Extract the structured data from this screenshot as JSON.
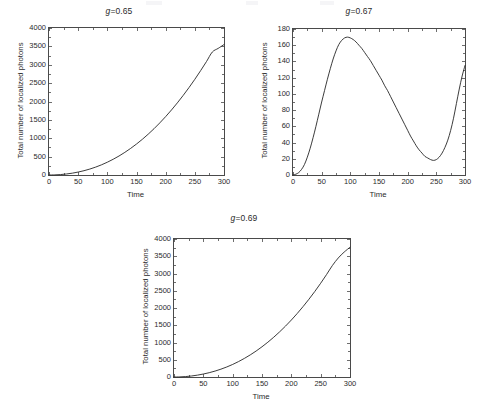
{
  "figure": {
    "background_color": "#ffffff",
    "axis_color": "#4a4a4a",
    "curve_color": "#262626"
  },
  "chart_data": [
    {
      "type": "line",
      "id": "g065",
      "title": "g=0.65",
      "title_symbol": "g",
      "title_rest": "=0.65",
      "xlabel": "Time",
      "ylabel": "Total number of localized photons",
      "xlim": [
        0,
        300
      ],
      "ylim": [
        0,
        4000
      ],
      "xticks": [
        0,
        50,
        100,
        150,
        200,
        250,
        300
      ],
      "xticklabels": [
        "0",
        "50",
        "100",
        "150",
        "200",
        "250",
        "300"
      ],
      "yticks": [
        0,
        500,
        1000,
        1500,
        2000,
        2500,
        3000,
        3500,
        4000
      ],
      "yticklabels": [
        "0",
        "500",
        "1000",
        "1500",
        "2000",
        "2500",
        "3000",
        "3500",
        "4000"
      ],
      "grid": false,
      "legend": "none",
      "series": [
        {
          "name": "Total number of localized photons",
          "x": [
            0,
            10,
            20,
            30,
            40,
            50,
            60,
            70,
            80,
            90,
            100,
            110,
            120,
            130,
            140,
            150,
            160,
            170,
            180,
            190,
            200,
            210,
            220,
            230,
            240,
            250,
            260,
            270,
            280,
            290,
            300
          ],
          "values": [
            0,
            3,
            12,
            28,
            50,
            80,
            117,
            162,
            215,
            277,
            348,
            428,
            517,
            616,
            724,
            843,
            971,
            1110,
            1259,
            1419,
            1589,
            1770,
            1962,
            2165,
            2379,
            2604,
            2841,
            3088,
            3347,
            3445,
            3550
          ]
        }
      ]
    },
    {
      "type": "line",
      "id": "g067",
      "title": "g=0.67",
      "title_symbol": "g",
      "title_rest": "=0.67",
      "xlabel": "Time",
      "ylabel": "Total number of localized photons",
      "xlim": [
        0,
        300
      ],
      "ylim": [
        0,
        180
      ],
      "xticks": [
        0,
        50,
        100,
        150,
        200,
        250,
        300
      ],
      "xticklabels": [
        "0",
        "50",
        "100",
        "150",
        "200",
        "250",
        "300"
      ],
      "yticks": [
        0,
        20,
        40,
        60,
        80,
        100,
        120,
        140,
        160,
        180
      ],
      "yticklabels": [
        "0",
        "20",
        "40",
        "60",
        "80",
        "100",
        "120",
        "140",
        "160",
        "180"
      ],
      "grid": false,
      "legend": "none",
      "series": [
        {
          "name": "Total number of localized photons",
          "x": [
            0,
            5,
            10,
            15,
            20,
            25,
            30,
            35,
            40,
            45,
            50,
            55,
            60,
            65,
            70,
            75,
            80,
            85,
            90,
            95,
            100,
            105,
            110,
            115,
            120,
            125,
            130,
            135,
            140,
            145,
            150,
            155,
            160,
            165,
            170,
            175,
            180,
            185,
            190,
            195,
            200,
            205,
            210,
            215,
            220,
            225,
            230,
            235,
            240,
            245,
            250,
            255,
            260,
            265,
            270,
            275,
            280,
            285,
            290,
            295,
            300
          ],
          "values": [
            0,
            1,
            3,
            7,
            13,
            22,
            33,
            46,
            60,
            75,
            90,
            104,
            118,
            131,
            143,
            153,
            161,
            166,
            169,
            170,
            169,
            167,
            164,
            160,
            156,
            151,
            146,
            141,
            135,
            129,
            123,
            117,
            110,
            104,
            97,
            90,
            83,
            76,
            69,
            62,
            55,
            48,
            42,
            36,
            31,
            27,
            23,
            21,
            19,
            18,
            19,
            22,
            27,
            34,
            43,
            55,
            70,
            88,
            106,
            122,
            135
          ]
        }
      ]
    },
    {
      "type": "line",
      "id": "g069",
      "title": "g=0.69",
      "title_symbol": "g",
      "title_rest": "=0.69",
      "xlabel": "Time",
      "ylabel": "Total number of localized photons",
      "xlim": [
        0,
        300
      ],
      "ylim": [
        0,
        4000
      ],
      "xticks": [
        0,
        50,
        100,
        150,
        200,
        250,
        300
      ],
      "xticklabels": [
        "0",
        "50",
        "100",
        "150",
        "200",
        "250",
        "300"
      ],
      "yticks": [
        0,
        500,
        1000,
        1500,
        2000,
        2500,
        3000,
        3500,
        4000
      ],
      "yticklabels": [
        "0",
        "500",
        "1000",
        "1500",
        "2000",
        "2500",
        "3000",
        "3500",
        "4000"
      ],
      "grid": false,
      "legend": "none",
      "series": [
        {
          "name": "Total number of localized photons",
          "x": [
            0,
            10,
            20,
            30,
            40,
            50,
            60,
            70,
            80,
            90,
            100,
            110,
            120,
            130,
            140,
            150,
            160,
            170,
            180,
            190,
            200,
            210,
            220,
            230,
            240,
            250,
            260,
            270,
            280,
            290,
            300
          ],
          "values": [
            0,
            3,
            13,
            30,
            54,
            86,
            125,
            172,
            227,
            291,
            364,
            447,
            539,
            641,
            753,
            876,
            1009,
            1153,
            1308,
            1474,
            1651,
            1840,
            2041,
            2254,
            2479,
            2717,
            2968,
            3232,
            3450,
            3620,
            3760
          ]
        }
      ]
    }
  ]
}
